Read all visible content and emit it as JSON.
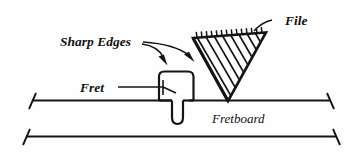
{
  "figure": {
    "background_color": "#fefefe",
    "ink_color": "#141414",
    "labels": {
      "sharp_edges": "Sharp Edges",
      "file": "File",
      "fret": "Fret",
      "fretboard": "Fretboard"
    },
    "parts": [
      {
        "name": "file",
        "description": "triangular file with serrated top edge and diagonal hatching"
      },
      {
        "name": "fret",
        "description": "fret crown with tang seated in fretboard slot"
      },
      {
        "name": "fretboard",
        "description": "fretboard shown as two horizontal edge lines with slanted end ticks"
      }
    ],
    "annotations": [
      {
        "label": "Sharp Edges",
        "arrows": 2,
        "points_to": "fret crown edges"
      },
      {
        "label": "File",
        "arrows": 0,
        "points_to": "file body (leader line)"
      },
      {
        "label": "Fret",
        "arrows": 0,
        "points_to": "fret crown (leader line)"
      },
      {
        "label": "Fretboard",
        "arrows": 0,
        "points_to": "fretboard surface"
      }
    ]
  }
}
